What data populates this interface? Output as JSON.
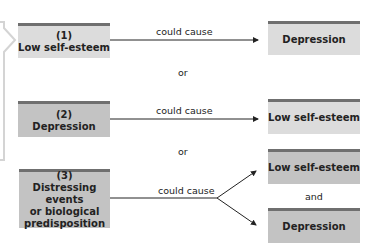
{
  "diagram": {
    "row1": {
      "source": {
        "number": "(1)",
        "label": "Low self-esteem"
      },
      "relation": "could cause",
      "target": {
        "label": "Depression"
      }
    },
    "separator1": "or",
    "row2": {
      "source": {
        "number": "(2)",
        "label": "Depression"
      },
      "relation": "could cause",
      "target": {
        "label": "Low self-esteem"
      }
    },
    "separator2": "or",
    "row3": {
      "source": {
        "number": "(3)",
        "label_lines": [
          "Distressing events",
          "or biological",
          "predisposition"
        ]
      },
      "relation": "could cause",
      "targets": [
        {
          "label": "Low self-esteem"
        },
        {
          "label": "Depression"
        }
      ],
      "conjunction": "and"
    }
  },
  "colors": {
    "box_light": "#dcdcdc",
    "box_dark": "#c3c3c3",
    "box_border": "#6f6f6f",
    "arrow": "#222222",
    "callout": "#d4d4d4"
  }
}
